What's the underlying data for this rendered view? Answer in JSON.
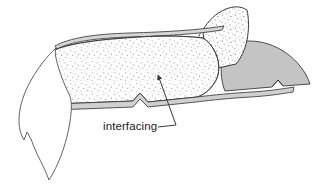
{
  "figure": {
    "kind": "technical-illustration",
    "background_color": "#ffffff",
    "width": 321,
    "height": 184
  },
  "annotations": [
    {
      "id": "interfacing",
      "label": "interfacing",
      "text_x": 103,
      "text_y": 130,
      "leader_from_x": 176,
      "leader_from_y": 125,
      "leader_to_x": 158,
      "leader_to_y": 75,
      "has_arrowhead": true
    }
  ],
  "regions": {
    "main_body": {
      "name": "interfaced-fabric-panel",
      "fill": "#ffffff",
      "texture": "stipple-dots",
      "dot_color": "#9a9a9a",
      "stroke": "#3a3a3a"
    },
    "upper_flap": {
      "name": "folded-up-corner-flap",
      "fill": "#ffffff",
      "texture": "stipple-dots",
      "stroke": "#3a3a3a"
    },
    "shaded_panel": {
      "name": "under-layer-shaded-panel",
      "fill": "#c4c4c4",
      "stroke": "#3a3a3a"
    },
    "left_flap": {
      "name": "hanging-left-flap",
      "fill": "#ffffff",
      "stroke": "#5a5a5a"
    },
    "top_seam": {
      "name": "top-folded-seam-edge",
      "fill": "#d8d8d8",
      "stroke": "#3a3a3a"
    },
    "bottom_seam": {
      "name": "bottom-folded-seam-edge",
      "fill": "#d0d0d0",
      "stroke": "#3a3a3a"
    }
  },
  "colors": {
    "outline": "#3a3a3a",
    "outline_light": "#5a5a5a",
    "shade_gray": "#c4c4c4",
    "seam_gray": "#d4d4d4",
    "stipple": "#9a9a9a",
    "text": "#1c1c1c",
    "background": "#ffffff"
  }
}
